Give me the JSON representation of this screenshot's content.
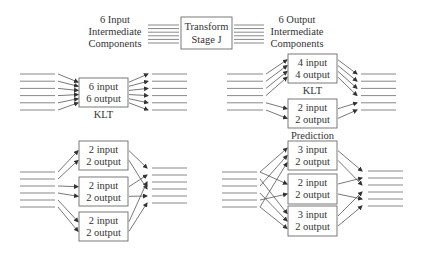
{
  "header": {
    "input_label": [
      "6 Input",
      "Intermediate",
      "Components"
    ],
    "stage_label": [
      "Transform",
      "Stage J"
    ],
    "output_label": [
      "6 Output",
      "Intermediate",
      "Components"
    ],
    "component_count": 6
  },
  "panels": [
    {
      "id": "klt-6x6",
      "blocks": [
        {
          "lines": [
            "6 input",
            "6 output"
          ],
          "caption": "KLT",
          "inputs": [
            0,
            1,
            2,
            3,
            4,
            5
          ],
          "outputs": [
            0,
            1,
            2,
            3,
            4,
            5
          ]
        }
      ]
    },
    {
      "id": "klt-4x4-plus-prediction",
      "blocks": [
        {
          "lines": [
            "4 input",
            "4 output"
          ],
          "caption": "KLT",
          "inputs": [
            0,
            1,
            2,
            3
          ],
          "outputs": [
            0,
            1,
            2,
            3
          ]
        },
        {
          "lines": [
            "2 input",
            "2 output"
          ],
          "caption": "Prediction",
          "inputs": [
            4,
            5
          ],
          "outputs": [
            4,
            5
          ]
        }
      ]
    },
    {
      "id": "three-2x2",
      "blocks": [
        {
          "lines": [
            "2 input",
            "2 output"
          ],
          "caption": "",
          "inputs": [
            0,
            1
          ],
          "outputs": [
            0,
            3
          ]
        },
        {
          "lines": [
            "2 input",
            "2 output"
          ],
          "caption": "",
          "inputs": [
            2,
            3
          ],
          "outputs": [
            1,
            4
          ]
        },
        {
          "lines": [
            "2 input",
            "2 output"
          ],
          "caption": "",
          "inputs": [
            4,
            5
          ],
          "outputs": [
            2,
            5
          ]
        }
      ]
    },
    {
      "id": "3x2-2x2-3x2",
      "blocks": [
        {
          "lines": [
            "3 input",
            "2 output"
          ],
          "caption": "",
          "inputs": [
            0,
            2,
            5
          ],
          "outputs": [
            0,
            2
          ]
        },
        {
          "lines": [
            "2 input",
            "2 output"
          ],
          "caption": "",
          "inputs": [
            0,
            4
          ],
          "outputs": [
            1,
            4
          ]
        },
        {
          "lines": [
            "3 input",
            "2 output"
          ],
          "caption": "",
          "inputs": [
            1,
            3,
            5
          ],
          "outputs": [
            3,
            5
          ]
        }
      ]
    }
  ]
}
